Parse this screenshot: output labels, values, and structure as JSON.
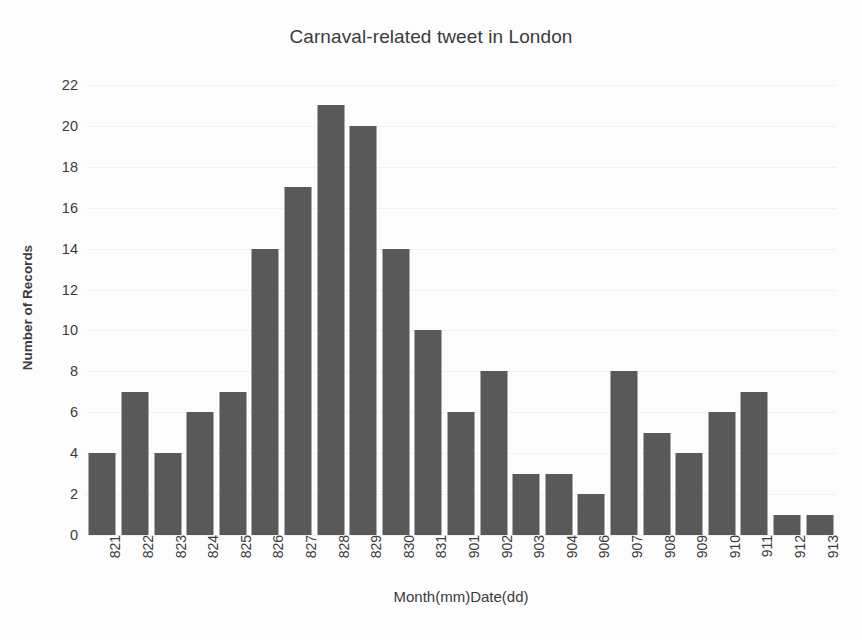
{
  "chart_data": {
    "type": "bar",
    "title": "Carnaval-related tweet in London",
    "xlabel": "Month(mm)Date(dd)",
    "ylabel": "Number of Records",
    "categories": [
      "821",
      "822",
      "823",
      "824",
      "825",
      "826",
      "827",
      "828",
      "829",
      "830",
      "831",
      "901",
      "902",
      "903",
      "904",
      "906",
      "907",
      "908",
      "909",
      "910",
      "911",
      "912",
      "913"
    ],
    "values": [
      4,
      7,
      4,
      6,
      7,
      14,
      17,
      21,
      20,
      14,
      10,
      6,
      8,
      3,
      3,
      2,
      8,
      5,
      4,
      6,
      7,
      1,
      1
    ],
    "ylim": [
      0,
      22
    ],
    "ytick_step": 2,
    "yticks": [
      0,
      2,
      4,
      6,
      8,
      10,
      12,
      14,
      16,
      18,
      20,
      22
    ],
    "grid": true,
    "legend": null,
    "bar_color": "#595959",
    "gridline_color": "#f2f2f2",
    "background_color": "#fdfdfd",
    "text_color": "#3b3b3b"
  }
}
